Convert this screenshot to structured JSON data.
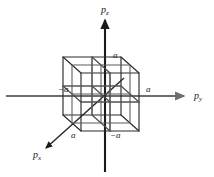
{
  "figure": {
    "background_color": "#ffffff",
    "axis_color": "#6e6e6e",
    "vertical_axis_color": "#1a1a1a",
    "cube_line_color": "#2b2b2b",
    "cube_inner_line_color": "#555555",
    "label_color": "#1a1a1a"
  },
  "axes": [
    {
      "name": "axis-pz",
      "symbol": "p",
      "subscript": "z",
      "direction": "up",
      "label_x": 101,
      "label_y": 5
    },
    {
      "name": "axis-py",
      "symbol": "p",
      "subscript": "y",
      "direction": "right",
      "label_x": 194,
      "label_y": 96
    },
    {
      "name": "axis-px",
      "symbol": "p",
      "subscript": "x",
      "direction": "down-left",
      "label_x": 33,
      "label_y": 152
    }
  ],
  "ticks": [
    {
      "name": "tick-pz-positive",
      "text": "a",
      "axis": "pz",
      "value": "a",
      "x": 113,
      "y": 54
    },
    {
      "name": "tick-py-negative",
      "text": "−a",
      "axis": "py",
      "value": "-a",
      "x": 61,
      "y": 87
    },
    {
      "name": "tick-py-positive",
      "text": "a",
      "axis": "py",
      "value": "a",
      "x": 145,
      "y": 87
    },
    {
      "name": "tick-px-positive",
      "text": "a",
      "axis": "px",
      "value": "a",
      "x": 71,
      "y": 130
    },
    {
      "name": "tick-pz-negative",
      "text": "−a",
      "axis": "pz",
      "value": "-a",
      "x": 111,
      "y": 130
    }
  ],
  "cube": {
    "side_label": "2a",
    "subdivisions": 2,
    "projection": "oblique",
    "front_face": {
      "left": 81,
      "right": 139,
      "top": 73,
      "bottom": 131
    },
    "depth_offset": {
      "dx": -18,
      "dy": -16
    }
  }
}
